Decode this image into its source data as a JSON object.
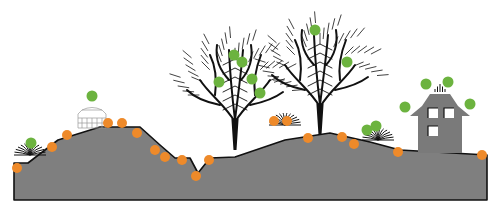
{
  "diagram": {
    "type": "landscape-cross-section",
    "colors": {
      "background": "#ffffff",
      "terrain_fill": "#7f7f7f",
      "terrain_outline": "#111111",
      "orange_marker": "#ee8a2a",
      "green_marker": "#6cb33f",
      "tree": "#111111",
      "house": "#7a7a7a",
      "house_window": "#ffffff"
    },
    "terrain": {
      "outline_points": [
        [
          14,
          168
        ],
        [
          14,
          163
        ],
        [
          28,
          163
        ],
        [
          58,
          140
        ],
        [
          100,
          127
        ],
        [
          140,
          127
        ],
        [
          160,
          145
        ],
        [
          175,
          158
        ],
        [
          190,
          158
        ],
        [
          198,
          173
        ],
        [
          210,
          158
        ],
        [
          235,
          157
        ],
        [
          285,
          140
        ],
        [
          330,
          133
        ],
        [
          370,
          142
        ],
        [
          400,
          150
        ],
        [
          487,
          155
        ],
        [
          487,
          200
        ],
        [
          14,
          200
        ]
      ]
    },
    "objects": [
      {
        "kind": "shrub",
        "label": "small-shrub-left",
        "x": 30,
        "y": 155
      },
      {
        "kind": "gazebo",
        "label": "glass-structure",
        "x": 92,
        "y": 110
      },
      {
        "kind": "tree",
        "label": "bare-tree-left",
        "x": 235,
        "y": 150
      },
      {
        "kind": "tree",
        "label": "bare-tree-right",
        "x": 320,
        "y": 135
      },
      {
        "kind": "shrub",
        "label": "shrub-middle",
        "x": 285,
        "y": 125
      },
      {
        "kind": "shrub",
        "label": "shrub-right",
        "x": 378,
        "y": 140
      },
      {
        "kind": "house",
        "label": "house",
        "x": 440,
        "y": 118
      }
    ],
    "orange_markers": [
      [
        17,
        168
      ],
      [
        52,
        147
      ],
      [
        67,
        135
      ],
      [
        108,
        123
      ],
      [
        122,
        123
      ],
      [
        137,
        133
      ],
      [
        155,
        150
      ],
      [
        165,
        157
      ],
      [
        182,
        160
      ],
      [
        196,
        176
      ],
      [
        209,
        160
      ],
      [
        274,
        121
      ],
      [
        287,
        121
      ],
      [
        308,
        138
      ],
      [
        342,
        137
      ],
      [
        354,
        144
      ],
      [
        398,
        152
      ],
      [
        482,
        155
      ]
    ],
    "green_markers": [
      [
        31,
        143
      ],
      [
        92,
        96
      ],
      [
        234,
        55
      ],
      [
        242,
        62
      ],
      [
        219,
        82
      ],
      [
        252,
        79
      ],
      [
        260,
        93
      ],
      [
        315,
        30
      ],
      [
        347,
        62
      ],
      [
        367,
        130
      ],
      [
        376,
        126
      ],
      [
        426,
        84
      ],
      [
        448,
        82
      ],
      [
        405,
        107
      ],
      [
        470,
        104
      ]
    ]
  }
}
